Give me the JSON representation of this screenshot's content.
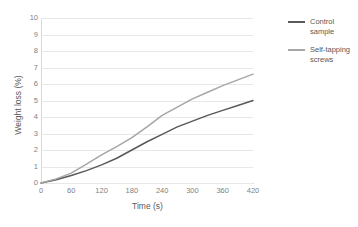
{
  "chart_data": {
    "type": "line",
    "title": "",
    "xlabel": "Time (s)",
    "ylabel": "Weight loss (%)",
    "xlim": [
      0,
      420
    ],
    "ylim": [
      0,
      10
    ],
    "grid": true,
    "legend_position": "right",
    "xticks": [
      "0",
      "60",
      "120",
      "180",
      "240",
      "300",
      "360",
      "420"
    ],
    "yticks": [
      "0",
      "1",
      "2",
      "3",
      "4",
      "5",
      "6",
      "7",
      "8",
      "9",
      "10"
    ],
    "x": [
      0,
      30,
      60,
      90,
      120,
      150,
      180,
      210,
      240,
      270,
      300,
      330,
      360,
      390,
      420
    ],
    "series": [
      {
        "name": "Control sample",
        "color": "#595959",
        "values": [
          0,
          0.2,
          0.45,
          0.75,
          1.1,
          1.5,
          2.0,
          2.5,
          2.95,
          3.4,
          3.75,
          4.1,
          4.4,
          4.7,
          5.0
        ]
      },
      {
        "name": "Self-tapping screws",
        "color": "#a6a6a6",
        "values": [
          0,
          0.25,
          0.6,
          1.15,
          1.7,
          2.2,
          2.75,
          3.4,
          4.1,
          4.6,
          5.1,
          5.5,
          5.9,
          6.25,
          6.6
        ]
      }
    ]
  },
  "legend": {
    "items": [
      {
        "label": "Control sample",
        "color": "#595959"
      },
      {
        "label": "Self-tapping screws",
        "color": "#a6a6a6"
      }
    ]
  }
}
